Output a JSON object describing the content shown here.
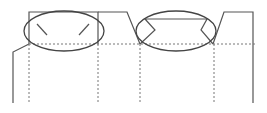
{
  "diagram": {
    "type": "box-dieline",
    "colors": {
      "cut_line": "#555555",
      "fold_line": "#777777",
      "highlight": "#444444",
      "background": "#ffffff"
    },
    "legend": {
      "solid": "cut line",
      "dotted": "fold line",
      "ellipse": "highlighted detail"
    },
    "highlights": [
      {
        "name": "left-top-flap-slits",
        "cx": 64,
        "cy": 31,
        "rx": 40,
        "ry": 20
      },
      {
        "name": "center-tuck-flap-notches",
        "cx": 176,
        "cy": 31,
        "rx": 40,
        "ry": 20
      }
    ]
  }
}
